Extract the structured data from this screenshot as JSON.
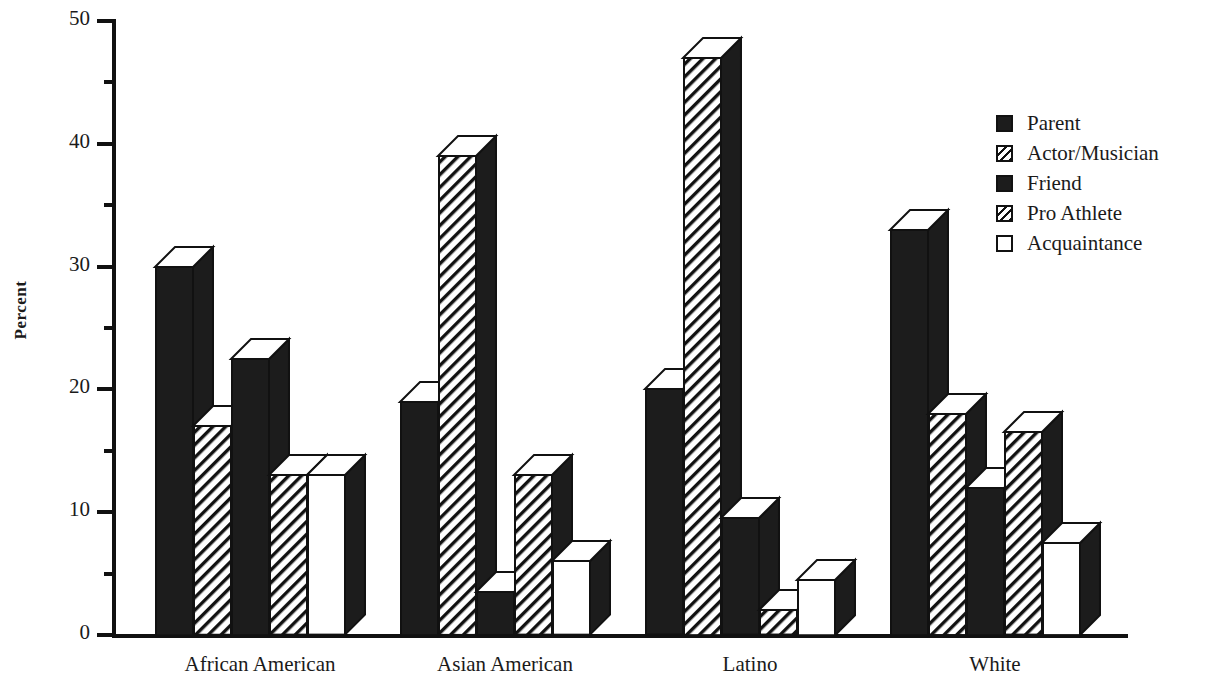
{
  "chart_data": {
    "type": "bar",
    "title": "",
    "subtitle": "",
    "xlabel": "",
    "ylabel": "Percent",
    "ylim": [
      0,
      50
    ],
    "y_ticks_major": [
      0,
      10,
      20,
      30,
      40,
      50
    ],
    "y_ticks_minor": [
      5,
      15,
      25,
      35,
      45
    ],
    "grid": false,
    "legend_position": "right",
    "categories": [
      "African American",
      "Asian American",
      "Latino",
      "White"
    ],
    "series": [
      {
        "name": "Parent",
        "fill": "solid",
        "values": [
          30,
          19,
          20,
          33
        ]
      },
      {
        "name": "Actor/Musician",
        "fill": "hatch",
        "values": [
          17,
          39,
          47,
          18
        ]
      },
      {
        "name": "Friend",
        "fill": "solid",
        "values": [
          22.5,
          3.5,
          9.5,
          12
        ]
      },
      {
        "name": "Pro Athlete",
        "fill": "hatch",
        "values": [
          13,
          13,
          2,
          16.5
        ]
      },
      {
        "name": "Acquaintance",
        "fill": "white",
        "values": [
          13,
          6,
          4.5,
          7.5
        ]
      }
    ]
  },
  "axis": {
    "y_title": "Percent",
    "y_tick_labels": [
      "50",
      "40",
      "30",
      "20",
      "10",
      "0"
    ],
    "x_tick_labels": [
      "African American",
      "Asian American",
      "Latino",
      "White"
    ]
  },
  "legend": {
    "items": [
      {
        "label": "Parent",
        "swatch": "solid-square-icon"
      },
      {
        "label": "Actor/Musician",
        "swatch": "hatched-square-icon"
      },
      {
        "label": "Friend",
        "swatch": "solid-square-icon"
      },
      {
        "label": "Pro Athlete",
        "swatch": "hatched-square-icon"
      },
      {
        "label": "Acquaintance",
        "swatch": "empty-square-icon"
      }
    ]
  },
  "colors": {
    "ink": "#1c1c1c",
    "background": "#ffffff",
    "outline": "#111111"
  }
}
